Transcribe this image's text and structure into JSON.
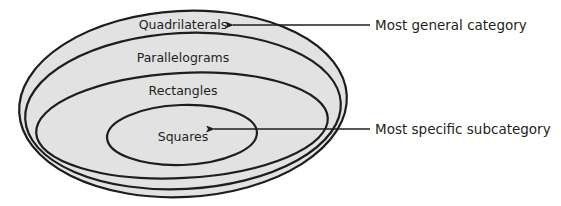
{
  "diagram": {
    "type": "nested-set (Euler) diagram",
    "colors": {
      "fill": "#e2e2e2",
      "stroke": "#1f1c1d",
      "text": "#231f20",
      "background": "#ffffff"
    },
    "sets": [
      {
        "label": "Quadrilaterals",
        "level": 1
      },
      {
        "label": "Parallelograms",
        "level": 2
      },
      {
        "label": "Rectangles",
        "level": 3
      },
      {
        "label": "Squares",
        "level": 4
      }
    ],
    "callouts": [
      {
        "text": "Most general category",
        "points_to": "Quadrilaterals"
      },
      {
        "text": "Most specific subcategory",
        "points_to": "Squares"
      }
    ]
  }
}
